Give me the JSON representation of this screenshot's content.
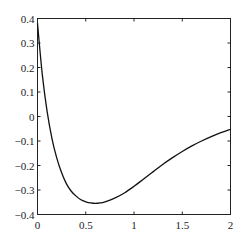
{
  "chart_data": {
    "type": "line",
    "title": "",
    "xlabel": "",
    "ylabel": "",
    "xlim": [
      0,
      2
    ],
    "ylim": [
      -0.4,
      0.4
    ],
    "grid": false,
    "legend": null,
    "x_ticks": [
      0,
      0.5,
      1,
      1.5,
      2
    ],
    "x_tick_labels": [
      "0",
      "0.5",
      "1",
      "1.5",
      "2"
    ],
    "y_ticks": [
      -0.4,
      -0.3,
      -0.2,
      -0.1,
      0,
      0.1,
      0.2,
      0.3,
      0.4
    ],
    "y_tick_labels": [
      "-0.4",
      "-0.3",
      "-0.2",
      "-0.1",
      "0",
      "0.1",
      "0.2",
      "0.3",
      "0.4"
    ],
    "values_are_approximate": true,
    "series": [
      {
        "name": "curve",
        "color": "#111111",
        "x": [
          0,
          0.05,
          0.1,
          0.15,
          0.2,
          0.25,
          0.3,
          0.35,
          0.4,
          0.45,
          0.5,
          0.55,
          0.6,
          0.65,
          0.7,
          0.8,
          0.9,
          1.0,
          1.1,
          1.2,
          1.3,
          1.4,
          1.5,
          1.6,
          1.7,
          1.8,
          1.9,
          2.0
        ],
        "y": [
          0.38,
          0.17,
          0.02,
          -0.09,
          -0.17,
          -0.23,
          -0.275,
          -0.305,
          -0.325,
          -0.34,
          -0.348,
          -0.353,
          -0.355,
          -0.353,
          -0.348,
          -0.333,
          -0.312,
          -0.285,
          -0.255,
          -0.225,
          -0.195,
          -0.168,
          -0.143,
          -0.12,
          -0.1,
          -0.082,
          -0.066,
          -0.052
        ]
      }
    ]
  }
}
